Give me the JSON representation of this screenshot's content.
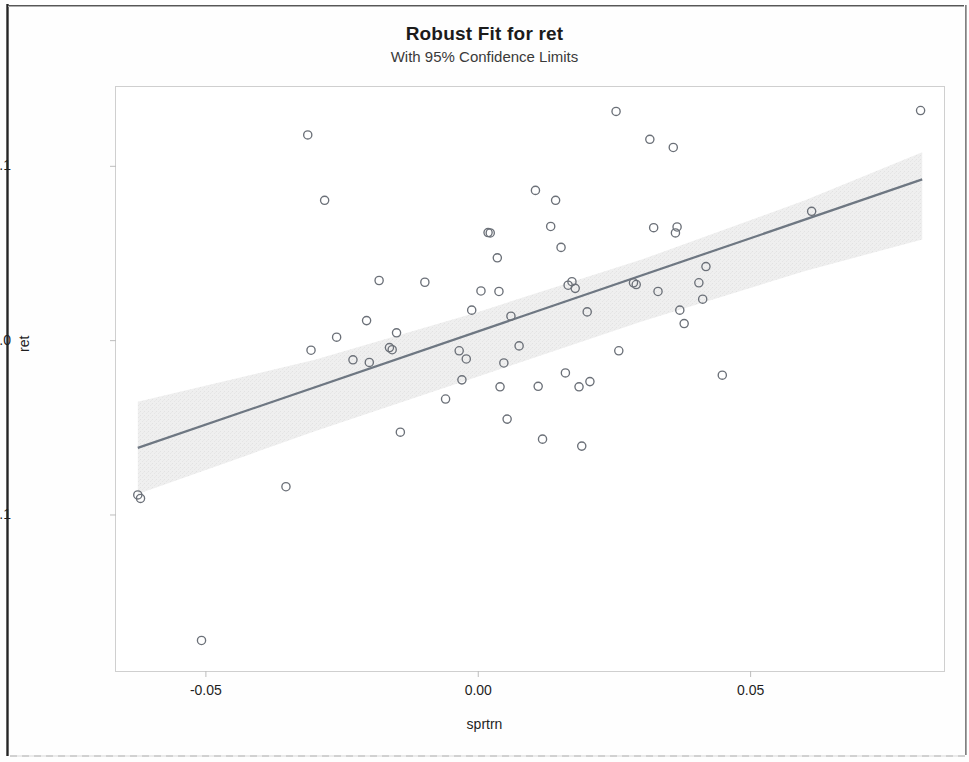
{
  "chart_data": {
    "type": "scatter",
    "title": "Robust Fit for ret",
    "subtitle": "With 95% Confidence Limits",
    "xlabel": "sprtrn",
    "ylabel": "ret",
    "xlim": [
      -0.0665,
      0.0855
    ],
    "ylim": [
      -0.1895,
      0.1455
    ],
    "xticks": [
      -0.05,
      0.0,
      0.05
    ],
    "xtick_labels": [
      "-0.05",
      "0.00",
      "0.05"
    ],
    "yticks": [
      0.1,
      0.0,
      -0.1
    ],
    "ytick_labels": [
      "0.1",
      "0.0",
      "-0.1"
    ],
    "grid": false,
    "legend": null,
    "marker": "open-circle",
    "marker_color": "#6b7078",
    "fit_line_color": "#6e7782",
    "confidence_band_color": "#ededed",
    "frame_color": "#cfcfcf",
    "fit_line": {
      "label": "Robust fit line",
      "x": [
        -0.0625,
        0.0815
      ],
      "y": [
        -0.0615,
        0.0925
      ]
    },
    "confidence_band": {
      "label": "95% confidence limits",
      "x": [
        -0.0625,
        -0.03,
        0.0,
        0.03,
        0.06,
        0.0815
      ],
      "lower": [
        -0.088,
        -0.052,
        -0.0205,
        0.011,
        0.04,
        0.058
      ],
      "upper": [
        -0.035,
        -0.011,
        0.0165,
        0.0465,
        0.0805,
        0.108
      ]
    },
    "series": [
      {
        "name": "ret vs sprtrn",
        "points": [
          {
            "x": -0.0625,
            "y": -0.0885
          },
          {
            "x": -0.062,
            "y": -0.0905
          },
          {
            "x": -0.0508,
            "y": -0.172
          },
          {
            "x": -0.0353,
            "y": -0.0838
          },
          {
            "x": -0.0313,
            "y": 0.118
          },
          {
            "x": -0.0307,
            "y": -0.0055
          },
          {
            "x": -0.0282,
            "y": 0.0805
          },
          {
            "x": -0.026,
            "y": 0.002
          },
          {
            "x": -0.023,
            "y": -0.011
          },
          {
            "x": -0.0205,
            "y": 0.0115
          },
          {
            "x": -0.02,
            "y": -0.0125
          },
          {
            "x": -0.0182,
            "y": 0.0345
          },
          {
            "x": -0.0163,
            "y": -0.004
          },
          {
            "x": -0.0158,
            "y": -0.0052
          },
          {
            "x": -0.015,
            "y": 0.0045
          },
          {
            "x": -0.0143,
            "y": -0.0525
          },
          {
            "x": -0.0098,
            "y": 0.0335
          },
          {
            "x": -0.006,
            "y": -0.0335
          },
          {
            "x": -0.0035,
            "y": -0.0058
          },
          {
            "x": -0.003,
            "y": -0.0225
          },
          {
            "x": -0.0022,
            "y": -0.0105
          },
          {
            "x": -0.0012,
            "y": 0.0175
          },
          {
            "x": 0.0005,
            "y": 0.0285
          },
          {
            "x": 0.0018,
            "y": 0.062
          },
          {
            "x": 0.0022,
            "y": 0.0618
          },
          {
            "x": 0.0035,
            "y": 0.0475
          },
          {
            "x": 0.0038,
            "y": 0.0282
          },
          {
            "x": 0.004,
            "y": -0.0265
          },
          {
            "x": 0.0047,
            "y": -0.0128
          },
          {
            "x": 0.0053,
            "y": -0.045
          },
          {
            "x": 0.006,
            "y": 0.014
          },
          {
            "x": 0.0075,
            "y": -0.003
          },
          {
            "x": 0.0105,
            "y": 0.0862
          },
          {
            "x": 0.011,
            "y": -0.0262
          },
          {
            "x": 0.0118,
            "y": -0.0565
          },
          {
            "x": 0.0133,
            "y": 0.0655
          },
          {
            "x": 0.0142,
            "y": 0.0805
          },
          {
            "x": 0.0152,
            "y": 0.0535
          },
          {
            "x": 0.016,
            "y": -0.0185
          },
          {
            "x": 0.0165,
            "y": 0.0318
          },
          {
            "x": 0.0172,
            "y": 0.0338
          },
          {
            "x": 0.0178,
            "y": 0.03
          },
          {
            "x": 0.0185,
            "y": -0.0265
          },
          {
            "x": 0.019,
            "y": -0.0605
          },
          {
            "x": 0.02,
            "y": 0.0165
          },
          {
            "x": 0.0205,
            "y": -0.0235
          },
          {
            "x": 0.0253,
            "y": 0.1315
          },
          {
            "x": 0.0258,
            "y": -0.0058
          },
          {
            "x": 0.0285,
            "y": 0.0332
          },
          {
            "x": 0.029,
            "y": 0.0322
          },
          {
            "x": 0.0315,
            "y": 0.1155
          },
          {
            "x": 0.0322,
            "y": 0.0648
          },
          {
            "x": 0.033,
            "y": 0.0282
          },
          {
            "x": 0.0358,
            "y": 0.1108
          },
          {
            "x": 0.0362,
            "y": 0.0618
          },
          {
            "x": 0.0365,
            "y": 0.0652
          },
          {
            "x": 0.037,
            "y": 0.0175
          },
          {
            "x": 0.0378,
            "y": 0.0098
          },
          {
            "x": 0.0405,
            "y": 0.0332
          },
          {
            "x": 0.0412,
            "y": 0.0238
          },
          {
            "x": 0.0418,
            "y": 0.0425
          },
          {
            "x": 0.0448,
            "y": -0.0198
          },
          {
            "x": 0.0612,
            "y": 0.0742
          },
          {
            "x": 0.0812,
            "y": 0.132
          }
        ]
      }
    ]
  },
  "axes": {
    "y_title": "ret",
    "x_title": "sprtrn"
  }
}
